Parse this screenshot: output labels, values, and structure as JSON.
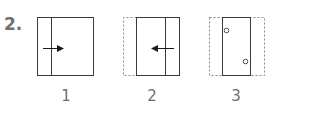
{
  "question_number": "2.",
  "panels": [
    {
      "label": "1",
      "description": "square with vertical line near left edge, arrow pointing right"
    },
    {
      "label": "2",
      "description": "left strip dashed, solid rectangle with vertical line near right edge, arrow pointing left"
    },
    {
      "label": "3",
      "description": "solid narrow rectangle inside dashed square, with two small circles (holes)"
    }
  ],
  "colors": {
    "line": "#3a3a3a",
    "dashed": "#8a8a8a",
    "text": "#707070"
  }
}
